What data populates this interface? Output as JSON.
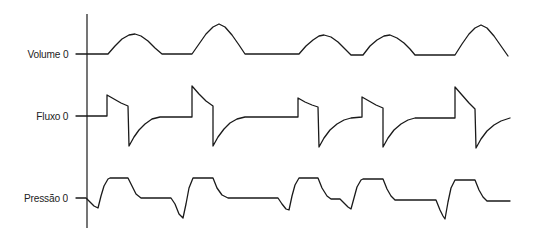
{
  "chart_data": {
    "type": "line",
    "title": "",
    "axis": {
      "x": 87,
      "y_top": 14,
      "y_bottom": 228
    },
    "series": [
      {
        "name": "Volume",
        "label": "Volume 0",
        "baseline_y": 54,
        "label_y": 54,
        "points": [
          [
            76,
            54
          ],
          [
            108,
            54
          ],
          [
            115,
            46
          ],
          [
            122,
            39
          ],
          [
            129,
            35
          ],
          [
            135,
            34
          ],
          [
            141,
            36
          ],
          [
            148,
            41
          ],
          [
            155,
            48
          ],
          [
            162,
            54
          ],
          [
            192,
            54
          ],
          [
            199,
            44
          ],
          [
            206,
            34
          ],
          [
            213,
            27
          ],
          [
            219,
            24
          ],
          [
            225,
            27
          ],
          [
            232,
            35
          ],
          [
            239,
            45
          ],
          [
            245,
            54
          ],
          [
            299,
            54
          ],
          [
            306,
            46
          ],
          [
            313,
            40
          ],
          [
            319,
            36
          ],
          [
            324,
            35
          ],
          [
            331,
            37
          ],
          [
            338,
            42
          ],
          [
            345,
            49
          ],
          [
            351,
            55
          ],
          [
            363,
            55
          ],
          [
            370,
            46
          ],
          [
            377,
            40
          ],
          [
            384,
            36
          ],
          [
            390,
            35
          ],
          [
            397,
            38
          ],
          [
            404,
            43
          ],
          [
            410,
            49
          ],
          [
            415,
            55
          ],
          [
            455,
            55
          ],
          [
            462,
            44
          ],
          [
            469,
            34
          ],
          [
            475,
            28
          ],
          [
            481,
            25
          ],
          [
            487,
            28
          ],
          [
            494,
            36
          ],
          [
            501,
            46
          ],
          [
            508,
            56
          ]
        ]
      },
      {
        "name": "Fluxo",
        "label": "Fluxo 0",
        "baseline_y": 116,
        "label_y": 116,
        "points": [
          [
            76,
            116
          ],
          [
            107,
            116
          ],
          [
            107,
            95
          ],
          [
            114,
            99
          ],
          [
            121,
            103
          ],
          [
            128,
            106
          ],
          [
            129,
            146
          ],
          [
            134,
            137
          ],
          [
            139,
            130
          ],
          [
            145,
            124
          ],
          [
            152,
            119
          ],
          [
            160,
            117
          ],
          [
            192,
            117
          ],
          [
            192,
            86
          ],
          [
            199,
            94
          ],
          [
            206,
            101
          ],
          [
            213,
            106
          ],
          [
            213,
            146
          ],
          [
            218,
            137
          ],
          [
            224,
            129
          ],
          [
            230,
            123
          ],
          [
            237,
            119
          ],
          [
            245,
            117
          ],
          [
            298,
            117
          ],
          [
            298,
            98
          ],
          [
            305,
            102
          ],
          [
            312,
            105
          ],
          [
            318,
            107
          ],
          [
            319,
            147
          ],
          [
            324,
            138
          ],
          [
            330,
            130
          ],
          [
            337,
            124
          ],
          [
            344,
            120
          ],
          [
            351,
            118
          ],
          [
            362,
            117
          ],
          [
            362,
            97
          ],
          [
            369,
            101
          ],
          [
            376,
            105
          ],
          [
            383,
            108
          ],
          [
            383,
            147
          ],
          [
            388,
            138
          ],
          [
            394,
            130
          ],
          [
            401,
            124
          ],
          [
            408,
            120
          ],
          [
            415,
            118
          ],
          [
            455,
            118
          ],
          [
            455,
            87
          ],
          [
            462,
            95
          ],
          [
            469,
            103
          ],
          [
            475,
            109
          ],
          [
            476,
            148
          ],
          [
            481,
            139
          ],
          [
            487,
            131
          ],
          [
            494,
            125
          ],
          [
            501,
            121
          ],
          [
            510,
            118
          ]
        ]
      },
      {
        "name": "Pressão",
        "label": "Pressão 0",
        "baseline_y": 198,
        "label_y": 198,
        "points": [
          [
            76,
            198
          ],
          [
            86,
            198
          ],
          [
            90,
            202
          ],
          [
            94,
            206
          ],
          [
            98,
            208
          ],
          [
            101,
            196
          ],
          [
            104,
            186
          ],
          [
            108,
            179
          ],
          [
            110,
            178
          ],
          [
            128,
            178
          ],
          [
            132,
            186
          ],
          [
            136,
            194
          ],
          [
            141,
            198
          ],
          [
            171,
            198
          ],
          [
            175,
            204
          ],
          [
            179,
            214
          ],
          [
            183,
            218
          ],
          [
            186,
            204
          ],
          [
            189,
            188
          ],
          [
            193,
            178
          ],
          [
            213,
            178
          ],
          [
            217,
            188
          ],
          [
            222,
            195
          ],
          [
            228,
            198
          ],
          [
            278,
            198
          ],
          [
            282,
            204
          ],
          [
            286,
            209
          ],
          [
            289,
            210
          ],
          [
            292,
            196
          ],
          [
            295,
            185
          ],
          [
            299,
            178
          ],
          [
            318,
            178
          ],
          [
            322,
            188
          ],
          [
            327,
            196
          ],
          [
            331,
            199
          ],
          [
            340,
            199
          ],
          [
            344,
            203
          ],
          [
            348,
            207
          ],
          [
            351,
            209
          ],
          [
            354,
            198
          ],
          [
            357,
            187
          ],
          [
            361,
            180
          ],
          [
            363,
            179
          ],
          [
            383,
            179
          ],
          [
            387,
            189
          ],
          [
            391,
            196
          ],
          [
            395,
            200
          ],
          [
            436,
            200
          ],
          [
            440,
            210
          ],
          [
            443,
            216
          ],
          [
            445,
            219
          ],
          [
            448,
            202
          ],
          [
            451,
            188
          ],
          [
            455,
            180
          ],
          [
            475,
            180
          ],
          [
            479,
            190
          ],
          [
            483,
            197
          ],
          [
            487,
            201
          ],
          [
            510,
            201
          ]
        ]
      }
    ],
    "xlabel": "",
    "ylabel": "",
    "grid": false,
    "legend": "none"
  },
  "labels": {
    "volume": "Volume 0",
    "fluxo": "Fluxo 0",
    "pressao": "Pressão 0"
  },
  "colors": {
    "trace": "#1a1a1a",
    "background": "#ffffff"
  }
}
